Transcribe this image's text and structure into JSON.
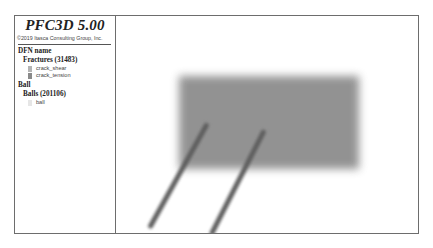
{
  "legend": {
    "title": "PFC3D 5.00",
    "copyright": "©2019 Itasca Consulting Group, Inc.",
    "groups": [
      {
        "heading": "DFN name",
        "subheading": "Fractures (31483)",
        "items": [
          {
            "label": "crack_shear",
            "color": "#b4b4b4"
          },
          {
            "label": "crack_tension",
            "color": "#8a8a8a"
          }
        ]
      },
      {
        "heading": "Ball",
        "subheading": "Balls (201106)",
        "items": [
          {
            "label": "ball",
            "color": "#e6e6e6"
          }
        ]
      }
    ]
  },
  "view": {
    "sample_color": "#8d8d8d",
    "crack_color": "#5e5e5e"
  }
}
